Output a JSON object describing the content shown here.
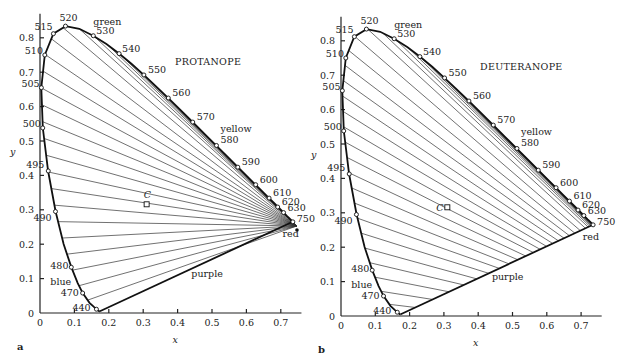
{
  "panels": [
    {
      "id": "a",
      "letter": "a",
      "title": "PROTANOPE",
      "axis": {
        "xlabel": "x",
        "ylabel": "y",
        "xticks": [
          "0",
          "0.1",
          "0.2",
          "0.3",
          "0.4",
          "0.5",
          "0.6",
          "0.7"
        ],
        "yticks": [
          "0",
          "0.1",
          "0.2",
          "0.3",
          "0.4",
          "0.5",
          "0.6",
          "0.7",
          "0.8"
        ]
      },
      "color_labels": {
        "green": "green",
        "yellow": "yellow",
        "red": "red",
        "purple": "purple",
        "blue": "blue"
      },
      "white_point_label": "C",
      "copunctal_point": {
        "x": 0.747,
        "y": 0.253
      }
    },
    {
      "id": "b",
      "letter": "b",
      "title": "DEUTERANOPE",
      "axis": {
        "xlabel": "x",
        "ylabel": "y",
        "xticks": [
          "0",
          "0.1",
          "0.2",
          "0.3",
          "0.4",
          "0.5",
          "0.6",
          "0.7"
        ],
        "yticks": [
          "0",
          "0.1",
          "0.2",
          "0.3",
          "0.4",
          "0.5",
          "0.6",
          "0.7",
          "0.8"
        ]
      },
      "color_labels": {
        "green": "green",
        "yellow": "yellow",
        "red": "red",
        "purple": "purple",
        "blue": "blue"
      },
      "white_point_label": "C",
      "copunctal_point": {
        "x": 1.08,
        "y": -0.08
      }
    }
  ],
  "chart_data": {
    "type": "diagram",
    "xlabel": "x",
    "ylabel": "y",
    "xlim": [
      0,
      0.75
    ],
    "ylim": [
      0,
      0.85
    ],
    "spectrum_locus_labels": [
      {
        "nm": "440",
        "x": 0.164,
        "y": 0.011
      },
      {
        "nm": "470",
        "x": 0.124,
        "y": 0.058
      },
      {
        "nm": "480",
        "x": 0.091,
        "y": 0.133
      },
      {
        "nm": "490",
        "x": 0.045,
        "y": 0.295
      },
      {
        "nm": "495",
        "x": 0.024,
        "y": 0.413
      },
      {
        "nm": "500",
        "x": 0.008,
        "y": 0.538
      },
      {
        "nm": "505",
        "x": 0.004,
        "y": 0.655
      },
      {
        "nm": "510",
        "x": 0.014,
        "y": 0.75
      },
      {
        "nm": "515",
        "x": 0.039,
        "y": 0.812
      },
      {
        "nm": "520",
        "x": 0.074,
        "y": 0.834
      },
      {
        "nm": "530",
        "x": 0.155,
        "y": 0.806
      },
      {
        "nm": "540",
        "x": 0.23,
        "y": 0.754
      },
      {
        "nm": "550",
        "x": 0.302,
        "y": 0.692
      },
      {
        "nm": "560",
        "x": 0.373,
        "y": 0.625
      },
      {
        "nm": "570",
        "x": 0.444,
        "y": 0.555
      },
      {
        "nm": "580",
        "x": 0.513,
        "y": 0.487
      },
      {
        "nm": "590",
        "x": 0.575,
        "y": 0.424
      },
      {
        "nm": "600",
        "x": 0.627,
        "y": 0.373
      },
      {
        "nm": "610",
        "x": 0.666,
        "y": 0.334
      },
      {
        "nm": "620",
        "x": 0.691,
        "y": 0.308
      },
      {
        "nm": "630",
        "x": 0.708,
        "y": 0.292
      },
      {
        "nm": "750",
        "x": 0.735,
        "y": 0.265
      }
    ],
    "white_point": {
      "label": "C",
      "x": 0.31,
      "y": 0.316
    },
    "panels": [
      {
        "letter": "a",
        "title": "PROTANOPE",
        "confusion_lines_converge_at": {
          "x": 0.747,
          "y": 0.253
        }
      },
      {
        "letter": "b",
        "title": "DEUTERANOPE",
        "confusion_lines_converge_at": "outside diagram, lower right"
      }
    ],
    "color_region_labels": [
      "green",
      "yellow",
      "red",
      "purple",
      "blue"
    ]
  }
}
